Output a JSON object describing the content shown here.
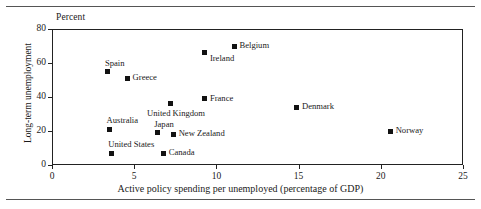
{
  "chart_data": {
    "type": "scatter",
    "title": "",
    "subtitle": "",
    "unit_caption": "Percent",
    "xlabel": "Active policy spending per unemployed (percentage of GDP)",
    "ylabel": "Long-term unemployment",
    "xlim": [
      0,
      25
    ],
    "ylim": [
      0,
      80
    ],
    "xticks": [
      "0",
      "5",
      "10",
      "15",
      "20",
      "25"
    ],
    "xtick_values": [
      0,
      5,
      10,
      15,
      20,
      25
    ],
    "yticks": [
      "0",
      "20",
      "40",
      "60",
      "80"
    ],
    "ytick_values": [
      0,
      20,
      40,
      60,
      80
    ],
    "grid": false,
    "legend": "none",
    "marker_shape": "square",
    "marker_color": "#121212",
    "points": [
      {
        "label": "Spain",
        "x": 3.4,
        "y": 55,
        "label_pos": "above-left"
      },
      {
        "label": "Greece",
        "x": 4.6,
        "y": 51,
        "label_pos": "right"
      },
      {
        "label": "Belgium",
        "x": 11.1,
        "y": 70,
        "label_pos": "right"
      },
      {
        "label": "Ireland",
        "x": 9.3,
        "y": 66,
        "label_pos": "below-right"
      },
      {
        "label": "France",
        "x": 9.3,
        "y": 39,
        "label_pos": "right"
      },
      {
        "label": "United Kingdom",
        "x": 7.2,
        "y": 36,
        "label_pos": "below"
      },
      {
        "label": "Denmark",
        "x": 14.9,
        "y": 34,
        "label_pos": "right"
      },
      {
        "label": "Australia",
        "x": 3.5,
        "y": 21,
        "label_pos": "above-left"
      },
      {
        "label": "Japan",
        "x": 6.4,
        "y": 19,
        "label_pos": "above-left"
      },
      {
        "label": "New Zealand",
        "x": 7.4,
        "y": 18,
        "label_pos": "right"
      },
      {
        "label": "Norway",
        "x": 20.6,
        "y": 20,
        "label_pos": "right"
      },
      {
        "label": "United States",
        "x": 3.6,
        "y": 7,
        "label_pos": "above-left"
      },
      {
        "label": "Canada",
        "x": 6.8,
        "y": 7,
        "label_pos": "right"
      }
    ]
  }
}
